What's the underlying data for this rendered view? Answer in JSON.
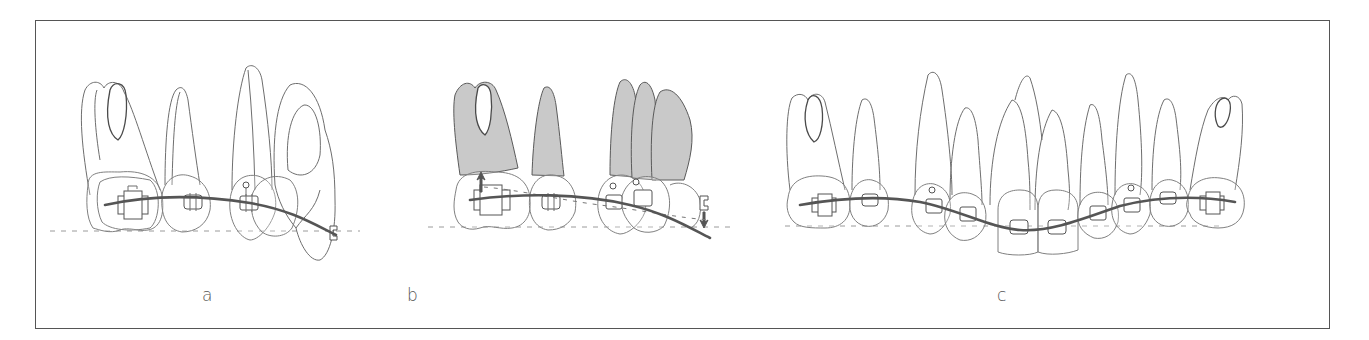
{
  "figure": {
    "colors": {
      "frame": "#555555",
      "outline": "#6e6e6e",
      "root_shade": "#c9c9c9",
      "wire": "#555555",
      "occlusal_line": "#9a9a9a"
    }
  },
  "panels": [
    {
      "id": "a",
      "label": "a",
      "teeth_count": 4,
      "shaded_roots": false,
      "has_force_arrows": false
    },
    {
      "id": "b",
      "label": "b",
      "teeth_count": 4,
      "shaded_roots": true,
      "has_force_arrows": true,
      "arrows": [
        {
          "direction": "up",
          "location": "molar"
        },
        {
          "direction": "down",
          "location": "canine"
        }
      ]
    },
    {
      "id": "c",
      "label": "c",
      "teeth_count": 12,
      "shaded_roots": false,
      "has_force_arrows": false
    }
  ]
}
